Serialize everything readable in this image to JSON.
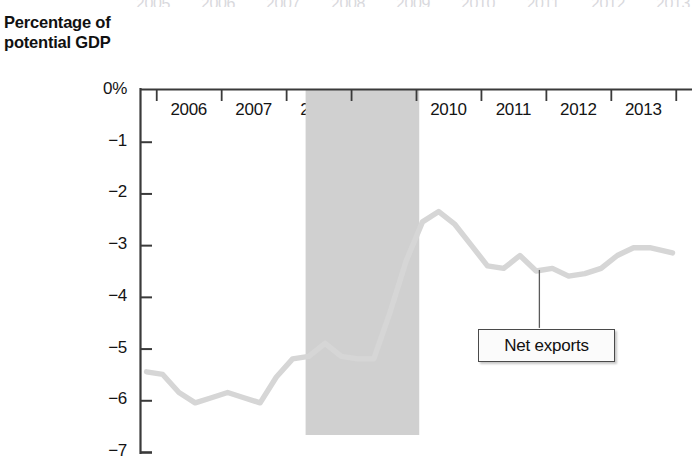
{
  "chart_data": {
    "type": "line",
    "title": "",
    "subtitle": "",
    "xlabel": "",
    "ylabel": "Percentage of\npotential GDP",
    "ylabel_line1": "Percentage of",
    "ylabel_line2": "potential GDP",
    "xlim": [
      2005.25,
      2013.75
    ],
    "ylim": [
      -7,
      0
    ],
    "grid": false,
    "legend_position": "inline-annotation",
    "ytick_labels": [
      "0%",
      "−1",
      "−2",
      "−3",
      "−4",
      "−5",
      "−6",
      "−7"
    ],
    "ytick_values": [
      0,
      -1,
      -2,
      -3,
      -4,
      -5,
      -6,
      -7
    ],
    "xtick_labels": [
      "2006",
      "2007",
      "2008",
      "2009",
      "2010",
      "2011",
      "2012",
      "2013"
    ],
    "xtick_values": [
      2006,
      2007,
      2008,
      2009,
      2010,
      2011,
      2012,
      2013
    ],
    "ghost_xtick_labels": [
      "2005",
      "2006",
      "2007",
      "2008",
      "2009",
      "2010",
      "2011",
      "2012",
      "2013"
    ],
    "series": [
      {
        "name": "Net exports",
        "color": "#d6d6d6",
        "x": [
          2005.35,
          2005.6,
          2005.85,
          2006.1,
          2006.35,
          2006.6,
          2006.85,
          2007.1,
          2007.35,
          2007.6,
          2007.85,
          2008.1,
          2008.35,
          2008.6,
          2008.85,
          2009.1,
          2009.35,
          2009.6,
          2009.85,
          2010.1,
          2010.35,
          2010.6,
          2010.85,
          2011.1,
          2011.35,
          2011.6,
          2011.85,
          2012.1,
          2012.35,
          2012.6,
          2012.85,
          2013.1,
          2013.45
        ],
        "y": [
          -5.45,
          -5.5,
          -5.85,
          -6.05,
          -5.95,
          -5.85,
          -5.95,
          -6.05,
          -5.55,
          -5.2,
          -5.15,
          -4.9,
          -5.15,
          -5.2,
          -5.2,
          -4.3,
          -3.3,
          -2.55,
          -2.35,
          -2.6,
          -3.0,
          -3.4,
          -3.45,
          -3.2,
          -3.5,
          -3.45,
          -3.6,
          -3.55,
          -3.45,
          -3.2,
          -3.05,
          -3.05,
          -3.15
        ]
      }
    ],
    "shaded_regions": [
      {
        "name": "recession-band",
        "x_start": 2007.8,
        "x_end": 2009.55,
        "color": "#d0d0d0"
      }
    ],
    "annotations": [
      {
        "name": "net-exports-callout",
        "label": "Net exports",
        "leader_x": 2011.4,
        "leader_y_top": -3.48,
        "leader_y_bottom": -4.6
      }
    ]
  },
  "callout": {
    "label": "Net exports"
  }
}
